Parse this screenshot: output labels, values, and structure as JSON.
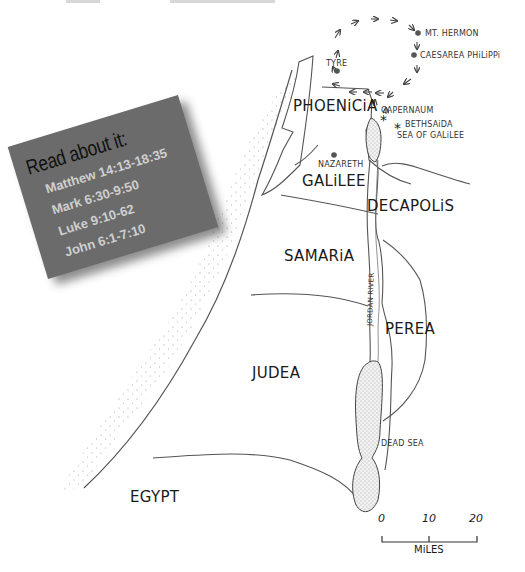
{
  "header_cutoff": {
    "left_text": "",
    "right_text": ""
  },
  "card": {
    "title": "Read about it:",
    "references": [
      "Matthew 14:13-18:35",
      "Mark 6:30-9:50",
      "Luke 9:10-62",
      "John 6:1-7:10"
    ],
    "background": "#6b6b6b",
    "text_color": "#cfcfcf"
  },
  "map": {
    "regions": {
      "phoenicia": "PHOENiCiA",
      "galilee": "GALiLEE",
      "decapolis": "DECAPOLiS",
      "samaria": "SAMARiA",
      "perea": "PEREA",
      "judea": "JUDEA",
      "egypt": "EGYPT"
    },
    "cities": {
      "tyre": "TYRE",
      "mt_hermon": "MT. HERMON",
      "caesarea_philippi": "CAESAREA PHiLiPPi",
      "capernaum": "CAPERNAUM",
      "bethsaida": "BETHSAiDA",
      "nazareth": "NAZARETH"
    },
    "water": {
      "sea_of_galilee": "SEA OF GALiLEE",
      "dead_sea": "DEAD SEA",
      "jordan_river": "JORDAN RiVER"
    },
    "scale": {
      "ticks": [
        "0",
        "10",
        "20"
      ],
      "unit": "MiLES"
    }
  }
}
